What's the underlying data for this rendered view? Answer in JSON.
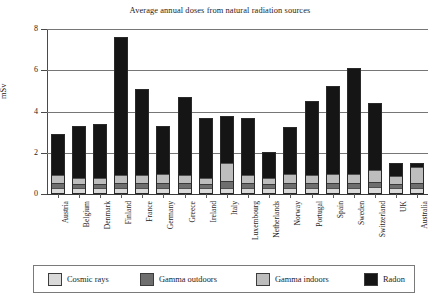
{
  "chart_data": {
    "type": "bar",
    "subtype": "stacked-bar",
    "title": "Average annual doses from natural radiation sources",
    "xlabel": "",
    "ylabel": "mSv",
    "ylim": [
      0,
      8
    ],
    "yticks": [
      0,
      2,
      4,
      6,
      8
    ],
    "ytick_labels": [
      "0",
      "2",
      "4",
      "6",
      "8"
    ],
    "grid": true,
    "grid_axis": "y",
    "legend_position": "bottom",
    "categories": [
      "Austria",
      "Belgium",
      "Denmark",
      "Finland",
      "France",
      "Germany",
      "Greece",
      "Ireland",
      "Italy",
      "Luxembourg",
      "Netherlands",
      "Norway",
      "Portugal",
      "Spain",
      "Sweden",
      "Switzerland",
      "UK",
      "Australia"
    ],
    "series": [
      {
        "name": "Cosmic rays",
        "color": "#d9d9d9",
        "values": [
          0.3,
          0.3,
          0.3,
          0.3,
          0.3,
          0.3,
          0.3,
          0.3,
          0.3,
          0.3,
          0.3,
          0.3,
          0.3,
          0.3,
          0.3,
          0.35,
          0.3,
          0.3
        ]
      },
      {
        "name": "Gamma outdoors",
        "color": "#6e6e6e",
        "values": [
          0.25,
          0.2,
          0.2,
          0.25,
          0.25,
          0.25,
          0.25,
          0.2,
          0.35,
          0.25,
          0.2,
          0.25,
          0.25,
          0.25,
          0.25,
          0.25,
          0.2,
          0.25
        ]
      },
      {
        "name": "Gamma indoors",
        "color": "#bdbdbd",
        "values": [
          0.35,
          0.3,
          0.3,
          0.35,
          0.35,
          0.4,
          0.35,
          0.3,
          0.85,
          0.35,
          0.3,
          0.4,
          0.35,
          0.4,
          0.4,
          0.55,
          0.35,
          0.75
        ]
      },
      {
        "name": "Radon",
        "color": "#151515",
        "values": [
          2.0,
          2.5,
          2.6,
          6.7,
          4.2,
          2.35,
          3.8,
          2.9,
          2.3,
          2.8,
          1.25,
          2.3,
          3.6,
          4.3,
          5.15,
          3.25,
          0.65,
          0.2
        ]
      }
    ],
    "totals": [
      2.9,
      3.3,
      3.4,
      7.6,
      5.1,
      3.3,
      4.7,
      3.7,
      3.8,
      3.7,
      2.05,
      3.25,
      4.5,
      5.25,
      6.0,
      4.4,
      1.5,
      1.5
    ]
  },
  "legend": {
    "items": [
      {
        "label": "Cosmic rays",
        "color": "#d9d9d9"
      },
      {
        "label": "Gamma outdoors",
        "color": "#6e6e6e"
      },
      {
        "label": "Gamma indoors",
        "color": "#bdbdbd"
      },
      {
        "label": "Radon",
        "color": "#151515"
      }
    ]
  }
}
